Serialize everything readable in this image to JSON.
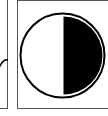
{
  "figure": {
    "panels": [
      {
        "id": "left",
        "content": "partial curve (cropped)"
      },
      {
        "id": "right",
        "content": "circle with right half filled"
      }
    ],
    "colors": {
      "stroke": "#000000",
      "fill": "#000000",
      "border": "#555555",
      "background": "#ffffff"
    },
    "symbol": {
      "type": "half-filled-circle",
      "filled_side": "right"
    }
  }
}
